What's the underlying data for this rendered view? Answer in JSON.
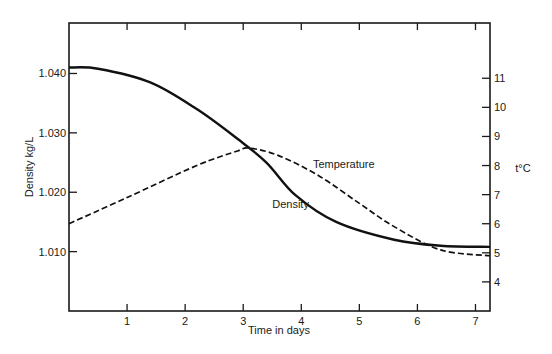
{
  "chart_data": {
    "type": "line",
    "title": "",
    "xlabel": "Time in days",
    "ylabel": "Density kg/L",
    "y2label": "t°C",
    "x_ticks": [
      1,
      2,
      3,
      4,
      5,
      6,
      7
    ],
    "xlim": [
      0,
      7.25
    ],
    "ylim": [
      1.0,
      1.0485
    ],
    "y_ticks": [
      "1.010",
      "1.020",
      "1.030",
      "1.040"
    ],
    "y2lim": [
      3.0,
      12.9
    ],
    "y2_ticks": [
      4,
      5,
      6,
      7,
      8,
      9,
      10,
      11
    ],
    "grid": false,
    "legend": "inline labels",
    "series": [
      {
        "name": "Density",
        "axis": "left",
        "style": "solid",
        "x": [
          0,
          0.5,
          1.4,
          2.2,
          2.9,
          3.4,
          3.9,
          4.6,
          5.6,
          6.4,
          7.25
        ],
        "values": [
          1.041,
          1.0408,
          1.0385,
          1.034,
          1.029,
          1.025,
          1.0195,
          1.015,
          1.012,
          1.011,
          1.0108
        ]
      },
      {
        "name": "Temperature",
        "axis": "right",
        "style": "dashed",
        "x": [
          0,
          1.0,
          2.2,
          2.9,
          3.1,
          3.6,
          4.3,
          5.0,
          5.6,
          6.4,
          7.25
        ],
        "values": [
          6.0,
          6.9,
          8.0,
          8.5,
          8.6,
          8.35,
          7.65,
          6.7,
          5.9,
          5.1,
          4.9
        ]
      }
    ],
    "annotations": [
      {
        "text": "Temperature",
        "x": 4.2,
        "y2": 7.9
      },
      {
        "text": "Density",
        "x": 3.5,
        "y2": 6.55
      }
    ]
  }
}
